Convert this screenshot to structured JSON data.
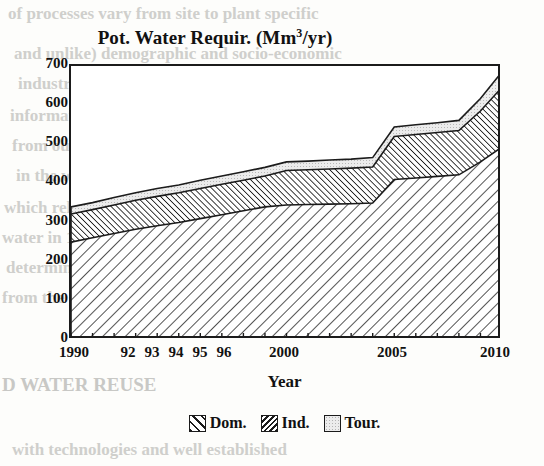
{
  "chart_data": {
    "type": "area",
    "title": "Pot. Water Requir. (Mm3/yr)",
    "title_main": "Pot. Water Requir. (Mm",
    "title_sup": "3",
    "title_tail": "/yr)",
    "xlabel": "Year",
    "ylabel": "",
    "stacked": true,
    "grid": false,
    "legend_position": "bottom-center",
    "xlim": [
      1990,
      2010
    ],
    "ylim": [
      0,
      700
    ],
    "yticks": [
      0,
      100,
      200,
      300,
      400,
      500,
      600,
      700
    ],
    "ytick_labels": [
      "0",
      "100",
      "200",
      "300",
      "400",
      "500",
      "600",
      "700"
    ],
    "xtick_labels": [
      "1990",
      "92",
      "93",
      "94",
      "95",
      "96",
      "2000",
      "2005",
      "2010"
    ],
    "xtick_values": [
      1990,
      1992,
      1993,
      1994,
      1995,
      1996,
      2000,
      2005,
      2010
    ],
    "x": [
      1990,
      1991,
      1992,
      1993,
      1994,
      1995,
      1996,
      1997,
      1998,
      1999,
      2000,
      2001,
      2002,
      2003,
      2004,
      2005,
      2006,
      2007,
      2008,
      2009,
      2010
    ],
    "series": [
      {
        "name": "Dom.",
        "pattern": "diagonal-hatch-forward",
        "values": [
          250,
          261,
          272,
          283,
          292,
          300,
          310,
          320,
          330,
          340,
          345,
          346,
          347,
          348,
          350,
          410,
          414,
          418,
          422,
          455,
          493
        ]
      },
      {
        "name": "Ind.",
        "pattern": "diagonal-hatch-dense-back",
        "values": [
          72,
          72,
          73,
          74,
          75,
          76,
          77,
          78,
          78,
          79,
          88,
          89,
          90,
          91,
          92,
          110,
          111,
          112,
          113,
          130,
          153
        ]
      },
      {
        "name": "Tour.",
        "pattern": "light-dotted",
        "values": [
          18,
          18,
          19,
          19,
          20,
          20,
          21,
          21,
          22,
          22,
          22,
          22,
          23,
          23,
          24,
          24,
          25,
          25,
          26,
          32,
          39
        ]
      }
    ],
    "cumulative_top": {
      "dom": [
        250,
        261,
        272,
        283,
        292,
        300,
        310,
        320,
        330,
        340,
        345,
        346,
        347,
        348,
        350,
        410,
        414,
        418,
        422,
        455,
        493
      ],
      "ind": [
        322,
        333,
        345,
        357,
        367,
        376,
        387,
        398,
        408,
        419,
        433,
        435,
        437,
        439,
        442,
        520,
        525,
        530,
        535,
        585,
        646
      ],
      "tour": [
        340,
        351,
        364,
        376,
        387,
        396,
        408,
        419,
        430,
        441,
        455,
        457,
        460,
        462,
        466,
        544,
        550,
        555,
        561,
        617,
        685
      ]
    },
    "legend": [
      {
        "label": "Dom.",
        "pattern": "diagonal-hatch-forward"
      },
      {
        "label": "Ind.",
        "pattern": "diagonal-hatch-dense-back"
      },
      {
        "label": "Tour.",
        "pattern": "light-dotted"
      }
    ],
    "colors": {
      "axis": "#1b1b1b",
      "plot_background": "#ffffff",
      "page_background": "#fdfdfb",
      "hatch": "#1b1b1b",
      "tour_fill": "#e8e8e8"
    }
  },
  "background_text": [
    "of processes vary from site to plant specific",
    "and unlike) demographic and socio-economic",
    "industry factors. Is an attempt to the available",
    "information or techniques the same with",
    "from ours and no clearly accessible in the data",
    "in the way of detail available in the T & A",
    "which relatively the local were of quanti-",
    "water in 1993 in the rate of conditions of",
    "determined and of some systems in the",
    "from the growth in the year are the stated",
    "D WATER REUSE",
    "with technologies and well established"
  ]
}
